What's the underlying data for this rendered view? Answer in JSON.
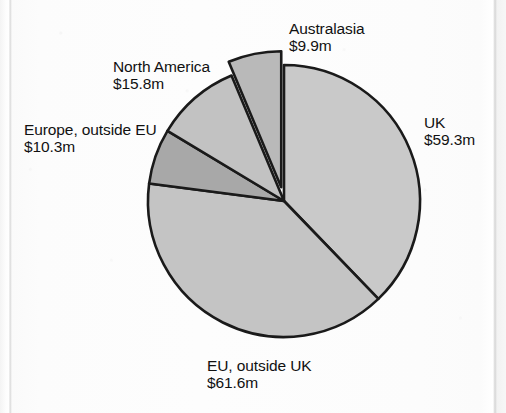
{
  "chart_data": {
    "type": "pie",
    "title": "",
    "subtitle": "",
    "xlabel": "",
    "ylabel": "",
    "legend_position": "none",
    "grid": false,
    "value_unit": "$m",
    "total": 156.9,
    "categories": [
      "UK",
      "EU, outside UK",
      "Europe, outside EU",
      "North America",
      "Australasia"
    ],
    "values": [
      59.3,
      61.6,
      10.3,
      15.8,
      9.9
    ],
    "value_labels": [
      "$59.3m",
      "$61.6m",
      "$10.3m",
      "$15.8m",
      "$9.9m"
    ],
    "slices": [
      {
        "name": "UK",
        "value": 59.3,
        "value_label": "$59.3m",
        "percent": 37.8,
        "fill": "#c9c9c9",
        "stroke": "#1a1a1a",
        "exploded": false,
        "label_position": "right"
      },
      {
        "name": "EU, outside UK",
        "value": 61.6,
        "value_label": "$61.6m",
        "percent": 39.3,
        "fill": "#c4c4c4",
        "stroke": "#1a1a1a",
        "exploded": false,
        "label_position": "bottom"
      },
      {
        "name": "Europe, outside EU",
        "value": 10.3,
        "value_label": "$10.3m",
        "percent": 6.6,
        "fill": "#a8a8a8",
        "stroke": "#1a1a1a",
        "exploded": false,
        "label_position": "left"
      },
      {
        "name": "North America",
        "value": 15.8,
        "value_label": "$15.8m",
        "percent": 10.1,
        "fill": "#c2c2c2",
        "stroke": "#1a1a1a",
        "exploded": false,
        "label_position": "top-left"
      },
      {
        "name": "Australasia",
        "value": 9.9,
        "value_label": "$9.9m",
        "percent": 6.3,
        "fill": "#b9b9b9",
        "stroke": "#1a1a1a",
        "exploded": true,
        "label_position": "top-right"
      }
    ]
  },
  "labels": {
    "australasia": {
      "name": "Australasia",
      "value": "$9.9m"
    },
    "uk": {
      "name": "UK",
      "value": "$59.3m"
    },
    "north_america": {
      "name": "North America",
      "value": "$15.8m"
    },
    "europe_outside": {
      "name": "Europe, outside EU",
      "value": "$10.3m"
    },
    "eu_outside_uk": {
      "name": "EU, outside UK",
      "value": "$61.6m"
    }
  },
  "colors": {
    "page_background": "#fbfbfb",
    "slice_light": "#c9c9c9",
    "slice_dark": "#a8a8a8",
    "outline": "#1a1a1a",
    "text": "#111111"
  }
}
